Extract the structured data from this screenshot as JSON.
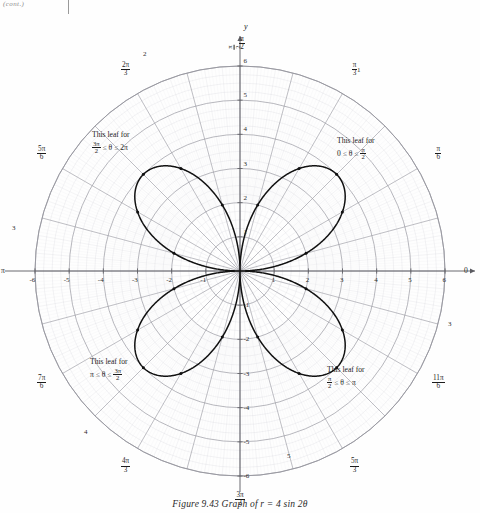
{
  "scan": {
    "corner_text": "(cont.)"
  },
  "caption": {
    "text": "Figure 9.43   Graph of r = 4 sin 2θ"
  },
  "axes": {
    "x_label": "x",
    "y_label": "y",
    "origin_label": "0",
    "left_pi_label": "π",
    "top_half_pi": {
      "num": "π",
      "den": "2"
    }
  },
  "leaf_notes": [
    {
      "id": "leaf-note-q1",
      "line1": "This leaf for",
      "prefix": "0 ≤ θ ≤ ",
      "frac_num": "π",
      "frac_den": "2",
      "suffix": ""
    },
    {
      "id": "leaf-note-q2",
      "line1": "This leaf for",
      "prefix": "",
      "frac_num": "π",
      "frac_den": "2",
      "suffix": " ≤ θ ≤ π"
    },
    {
      "id": "leaf-note-q3",
      "line1": "This leaf for",
      "prefix": "π ≤ θ ≤ ",
      "frac_num": "3π",
      "frac_den": "2",
      "suffix": ""
    },
    {
      "id": "leaf-note-q4",
      "line1": "This leaf for",
      "prefix": "",
      "frac_num": "3π",
      "frac_den": "2",
      "suffix": " ≤ θ ≤ 2π"
    }
  ],
  "chart_data": {
    "type": "line",
    "subtype": "polar-rose",
    "title": "Graph of r = 4 sin 2θ",
    "equation": "r = 4 sin 2θ",
    "coordinate_system": "polar",
    "petal_count": 4,
    "petal_max_radius": 4,
    "petal_axis_angles_deg": [
      45,
      135,
      225,
      315
    ],
    "grid": {
      "on": true,
      "radial_circles": [
        1,
        2,
        3,
        4,
        5,
        6
      ],
      "radial_max": 6,
      "minor_circle_step": 0.25,
      "angular_spoke_step_deg": 5,
      "major_spoke_step_deg": 15
    },
    "axis_ranges": {
      "x": [
        -6,
        6
      ],
      "y": [
        -6,
        6
      ]
    },
    "x_tick_labels": [
      "-6",
      "-5",
      "-4",
      "-3",
      "-2",
      "-1",
      "1",
      "2",
      "3",
      "4",
      "5",
      "6"
    ],
    "y_tick_labels": [
      "-6",
      "-5",
      "-4",
      "-3",
      "-2",
      "-1",
      "1",
      "2",
      "3",
      "4",
      "5",
      "6"
    ],
    "angle_labels": [
      {
        "deg": 0,
        "text": "0",
        "num": "",
        "den": ""
      },
      {
        "deg": 30,
        "text": "",
        "num": "π",
        "den": "6"
      },
      {
        "deg": 60,
        "text": "",
        "num": "π",
        "den": "3"
      },
      {
        "deg": 90,
        "text": "",
        "num": "π",
        "den": "2"
      },
      {
        "deg": 120,
        "text": "",
        "num": "2π",
        "den": "3"
      },
      {
        "deg": 150,
        "text": "",
        "num": "5π",
        "den": "6"
      },
      {
        "deg": 180,
        "text": "π",
        "num": "",
        "den": ""
      },
      {
        "deg": 210,
        "text": "",
        "num": "7π",
        "den": "6"
      },
      {
        "deg": 240,
        "text": "",
        "num": "4π",
        "den": "3"
      },
      {
        "deg": 270,
        "text": "",
        "num": "3π",
        "den": "2"
      },
      {
        "deg": 300,
        "text": "",
        "num": "5π",
        "den": "3"
      },
      {
        "deg": 330,
        "text": "",
        "num": "11π",
        "den": "6"
      }
    ],
    "plotted_points_polar": [
      {
        "theta_deg": 15,
        "r": 2.0
      },
      {
        "theta_deg": 30,
        "r": 3.46
      },
      {
        "theta_deg": 45,
        "r": 4.0
      },
      {
        "theta_deg": 60,
        "r": 3.46
      },
      {
        "theta_deg": 75,
        "r": 2.0
      },
      {
        "theta_deg": 105,
        "r": 2.0
      },
      {
        "theta_deg": 120,
        "r": 3.46
      },
      {
        "theta_deg": 135,
        "r": 4.0
      },
      {
        "theta_deg": 150,
        "r": 3.46
      },
      {
        "theta_deg": 165,
        "r": 2.0
      },
      {
        "theta_deg": 195,
        "r": 2.0
      },
      {
        "theta_deg": 210,
        "r": 3.46
      },
      {
        "theta_deg": 225,
        "r": 4.0
      },
      {
        "theta_deg": 240,
        "r": 3.46
      },
      {
        "theta_deg": 255,
        "r": 2.0
      },
      {
        "theta_deg": 285,
        "r": 2.0
      },
      {
        "theta_deg": 300,
        "r": 3.46
      },
      {
        "theta_deg": 315,
        "r": 4.0
      },
      {
        "theta_deg": 330,
        "r": 3.46
      },
      {
        "theta_deg": 345,
        "r": 2.0
      }
    ],
    "colors": {
      "curve": "#111111",
      "grid_major": "#9a9aa2",
      "grid_minor": "#c9c9d0",
      "axis": "#5a5a60",
      "background": "#fefefe"
    }
  }
}
